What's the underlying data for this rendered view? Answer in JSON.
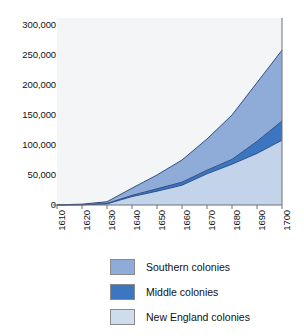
{
  "chart_data": {
    "type": "area",
    "stacked": true,
    "title": "",
    "subtitle": "",
    "xlabel": "",
    "ylabel": "",
    "x": [
      1610,
      1620,
      1630,
      1640,
      1650,
      1660,
      1670,
      1680,
      1690,
      1700
    ],
    "categories": [
      "1610",
      "1620",
      "1630",
      "1640",
      "1650",
      "1660",
      "1670",
      "1680",
      "1690",
      "1700"
    ],
    "xlim": [
      1610,
      1700
    ],
    "ylim": [
      0,
      300000
    ],
    "ytick_values": [
      0,
      50000,
      100000,
      150000,
      200000,
      250000,
      300000
    ],
    "ytick_labels": [
      "0",
      "50,000",
      "100,000",
      "150,000",
      "200,000",
      "250,000",
      "300,000"
    ],
    "grid": false,
    "legend_position": "bottom-left",
    "series": [
      {
        "name": "New England colonies",
        "color": "#c3d3ea",
        "values": [
          0,
          300,
          2000,
          14000,
          23000,
          33000,
          52000,
          68000,
          86000,
          108000
        ]
      },
      {
        "name": "Middle colonies",
        "color": "#3d76c0",
        "values": [
          0,
          100,
          500,
          2000,
          4000,
          5000,
          6000,
          8000,
          20000,
          32000
        ]
      },
      {
        "name": "Southern colonies",
        "color": "#8fabd8",
        "values": [
          300,
          1000,
          3000,
          12000,
          23000,
          37000,
          52000,
          74000,
          98000,
          118000
        ]
      }
    ],
    "cumulative_totals": [
      300,
      1400,
      5500,
      28000,
      50000,
      75000,
      110000,
      150000,
      204000,
      258000
    ],
    "legend_order": [
      "Southern colonies",
      "Middle colonies",
      "New England colonies"
    ]
  },
  "legend": {
    "items": [
      {
        "label": "Southern colonies",
        "color": "#8fabd8",
        "swatch": "legend-swatch-southern"
      },
      {
        "label": "Middle colonies",
        "color": "#3d76c0",
        "swatch": "legend-swatch-middle"
      },
      {
        "label": "New England colonies",
        "color": "#cfdcee",
        "swatch": "legend-swatch-new-england"
      }
    ]
  },
  "axes": {
    "y_labels": [
      "300,000",
      "250,000",
      "200,000",
      "150,000",
      "100,000",
      "50,000",
      "0"
    ],
    "x_labels": [
      "1610",
      "1620",
      "1630",
      "1640",
      "1650",
      "1660",
      "1670",
      "1680",
      "1690",
      "1700"
    ]
  },
  "colors": {
    "southern": "#8fabd8",
    "middle": "#3d76c0",
    "new_england": "#c3d3ea",
    "plot_background": "#f4f5f7",
    "axis_line": "#6e7076",
    "series_outline": "#2d4f86",
    "page_background": "#ffffff"
  }
}
